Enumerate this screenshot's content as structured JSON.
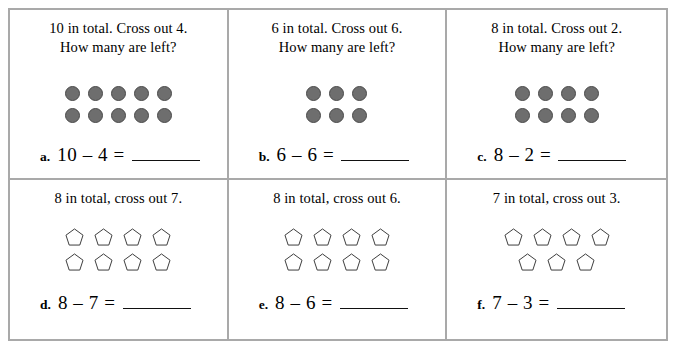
{
  "worksheet": {
    "title": "Subtraction with cross-out pictures",
    "border_color": "#a9a9a9",
    "circle_fill": "#6e6e6e",
    "pentagon_stroke": "#333333",
    "rows": [
      {
        "row_name": "circles-row",
        "shape": "circle",
        "cells": [
          {
            "id": "a",
            "prompt_line1": "10 in total. Cross out 4.",
            "prompt_line2": "How many are left?",
            "label": "a.",
            "equation": "10 – 4 =",
            "minuend": 10,
            "subtrahend": 4,
            "answer": "",
            "shape_rows": [
              5,
              5
            ],
            "total_shapes": 10
          },
          {
            "id": "b",
            "prompt_line1": "6 in total. Cross out 6.",
            "prompt_line2": "How many are left?",
            "label": "b.",
            "equation": "6 – 6 =",
            "minuend": 6,
            "subtrahend": 6,
            "answer": "",
            "shape_rows": [
              3,
              3
            ],
            "total_shapes": 6
          },
          {
            "id": "c",
            "prompt_line1": "8 in total. Cross out 2.",
            "prompt_line2": "How many are left?",
            "label": "c.",
            "equation": "8 – 2 =",
            "minuend": 8,
            "subtrahend": 2,
            "answer": "",
            "shape_rows": [
              4,
              4
            ],
            "total_shapes": 8
          }
        ]
      },
      {
        "row_name": "pentagons-row",
        "shape": "pentagon",
        "cells": [
          {
            "id": "d",
            "prompt_line1": "8 in total, cross out 7.",
            "prompt_line2": "",
            "label": "d.",
            "equation": "8 – 7 =",
            "minuend": 8,
            "subtrahend": 7,
            "answer": "",
            "shape_rows": [
              4,
              4
            ],
            "total_shapes": 8
          },
          {
            "id": "e",
            "prompt_line1": "8 in total, cross out 6.",
            "prompt_line2": "",
            "label": "e.",
            "equation": "8 – 6 =",
            "minuend": 8,
            "subtrahend": 6,
            "answer": "",
            "shape_rows": [
              4,
              4
            ],
            "total_shapes": 8
          },
          {
            "id": "f",
            "prompt_line1": "7 in total, cross out 3.",
            "prompt_line2": "",
            "label": "f.",
            "equation": "7 – 3 =",
            "minuend": 7,
            "subtrahend": 3,
            "answer": "",
            "shape_rows": [
              4,
              3
            ],
            "total_shapes": 7
          }
        ]
      }
    ]
  }
}
